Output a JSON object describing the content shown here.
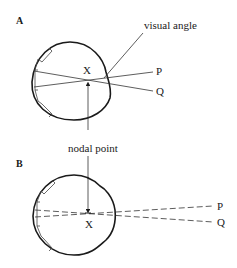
{
  "diagram": {
    "panels": [
      {
        "id": "A",
        "label": "A",
        "nodal_label": "X",
        "angle_label": "visual angle",
        "ray_labels": [
          "P",
          "Q"
        ],
        "ray_style": "solid"
      },
      {
        "id": "B",
        "label": "B",
        "nodal_label": "X",
        "ray_labels": [
          "P",
          "Q"
        ],
        "ray_style": "dashed"
      }
    ],
    "shared_label": "nodal point"
  }
}
